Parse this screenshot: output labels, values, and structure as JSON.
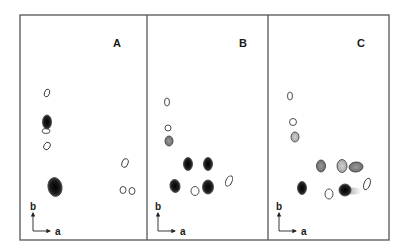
{
  "figure": {
    "frame": {
      "x": 20,
      "y": 15,
      "width": 369,
      "height": 225,
      "stroke": "#555555"
    },
    "dividers": [
      147,
      268
    ],
    "colors": {
      "dark_spot": "#1c1c1c",
      "grey_spot": "#8a8a8a",
      "light_grey_spot": "#b5b5b5",
      "outline": "#3a3a3a"
    },
    "panels": [
      {
        "label": "A",
        "label_pos": [
          117,
          47
        ],
        "axis": {
          "origin": [
            33,
            231
          ],
          "b_label": "b",
          "a_label": "a"
        },
        "spots": [
          {
            "cx": 47,
            "cy": 93,
            "rx": 2.5,
            "ry": 4,
            "fill": "open",
            "rot": 20
          },
          {
            "cx": 47,
            "cy": 122,
            "rx": 4.5,
            "ry": 7,
            "fill": "dark",
            "rot": 0
          },
          {
            "cx": 46,
            "cy": 131,
            "rx": 4,
            "ry": 2.5,
            "fill": "open",
            "rot": 0
          },
          {
            "cx": 47,
            "cy": 146,
            "rx": 3,
            "ry": 4,
            "fill": "open",
            "rot": 35
          },
          {
            "cx": 55,
            "cy": 187,
            "rx": 7,
            "ry": 9.5,
            "fill": "dark",
            "rot": -10
          },
          {
            "cx": 125,
            "cy": 163,
            "rx": 3,
            "ry": 4.5,
            "fill": "open",
            "rot": 20
          },
          {
            "cx": 123,
            "cy": 190,
            "rx": 3,
            "ry": 3.5,
            "fill": "open",
            "rot": 0
          },
          {
            "cx": 132,
            "cy": 191,
            "rx": 3,
            "ry": 3.5,
            "fill": "open",
            "rot": 0
          }
        ]
      },
      {
        "label": "B",
        "label_pos": [
          243,
          47
        ],
        "axis": {
          "origin": [
            158,
            231
          ],
          "b_label": "b",
          "a_label": "a"
        },
        "spots": [
          {
            "cx": 167,
            "cy": 102,
            "rx": 2.5,
            "ry": 4,
            "fill": "open",
            "rot": 0
          },
          {
            "cx": 168,
            "cy": 128,
            "rx": 3,
            "ry": 3,
            "fill": "open",
            "rot": 0
          },
          {
            "cx": 169,
            "cy": 141,
            "rx": 4,
            "ry": 5,
            "fill": "grey",
            "rot": 0
          },
          {
            "cx": 188,
            "cy": 164,
            "rx": 4.5,
            "ry": 6.5,
            "fill": "dark",
            "rot": 0
          },
          {
            "cx": 208,
            "cy": 164,
            "rx": 4.5,
            "ry": 6.5,
            "fill": "dark",
            "rot": 0
          },
          {
            "cx": 175,
            "cy": 186,
            "rx": 5,
            "ry": 6.5,
            "fill": "dark",
            "rot": -10
          },
          {
            "cx": 208,
            "cy": 187,
            "rx": 5.5,
            "ry": 7,
            "fill": "dark",
            "rot": 0
          },
          {
            "cx": 195,
            "cy": 191,
            "rx": 4,
            "ry": 4.5,
            "fill": "open",
            "rot": 0
          },
          {
            "cx": 229,
            "cy": 181,
            "rx": 3,
            "ry": 5.5,
            "fill": "open",
            "rot": 25
          }
        ]
      },
      {
        "label": "C",
        "label_pos": [
          361,
          47
        ],
        "axis": {
          "origin": [
            279,
            231
          ],
          "b_label": "b",
          "a_label": "a"
        },
        "spots": [
          {
            "cx": 290,
            "cy": 96,
            "rx": 2.5,
            "ry": 4,
            "fill": "open",
            "rot": 0
          },
          {
            "cx": 293,
            "cy": 122,
            "rx": 3.5,
            "ry": 3.5,
            "fill": "open",
            "rot": 0
          },
          {
            "cx": 295,
            "cy": 137,
            "rx": 4,
            "ry": 5,
            "fill": "light_grey",
            "rot": 0
          },
          {
            "cx": 321,
            "cy": 166,
            "rx": 4.5,
            "ry": 6,
            "fill": "grey",
            "rot": 0
          },
          {
            "cx": 342,
            "cy": 166,
            "rx": 5,
            "ry": 6.5,
            "fill": "light_grey",
            "rot": 0
          },
          {
            "cx": 356,
            "cy": 167,
            "rx": 7,
            "ry": 5,
            "fill": "grey",
            "rot": -5
          },
          {
            "cx": 302,
            "cy": 188,
            "rx": 4.5,
            "ry": 6.5,
            "fill": "dark",
            "rot": 0
          },
          {
            "cx": 329,
            "cy": 194,
            "rx": 4,
            "ry": 5,
            "fill": "open",
            "rot": 0
          },
          {
            "cx": 345,
            "cy": 190,
            "rx": 6,
            "ry": 6,
            "fill": "dark",
            "rot": 0,
            "smear": true
          },
          {
            "cx": 367,
            "cy": 184,
            "rx": 3,
            "ry": 6,
            "fill": "open",
            "rot": 20
          }
        ]
      }
    ]
  }
}
